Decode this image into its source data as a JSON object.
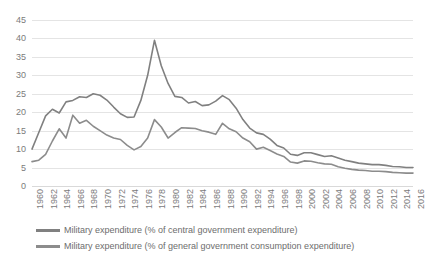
{
  "chart_data": {
    "type": "line",
    "title": "",
    "xlabel": "",
    "ylabel": "",
    "ylim": [
      0,
      45
    ],
    "ytick_step": 5,
    "yticks": [
      "0",
      "5",
      "10",
      "15",
      "20",
      "25",
      "30",
      "35",
      "40",
      "45"
    ],
    "grid": true,
    "legend_position": "bottom",
    "x": [
      1960,
      1961,
      1962,
      1963,
      1964,
      1965,
      1966,
      1967,
      1968,
      1969,
      1970,
      1971,
      1972,
      1973,
      1974,
      1975,
      1976,
      1977,
      1978,
      1979,
      1980,
      1981,
      1982,
      1983,
      1984,
      1985,
      1986,
      1987,
      1988,
      1989,
      1990,
      1991,
      1992,
      1993,
      1994,
      1995,
      1996,
      1997,
      1998,
      1999,
      2000,
      2001,
      2002,
      2003,
      2004,
      2005,
      2006,
      2007,
      2008,
      2009,
      2010,
      2011,
      2012,
      2013,
      2014,
      2015,
      2016
    ],
    "xtick_labels": [
      "1960",
      "1962",
      "1964",
      "1966",
      "1968",
      "1970",
      "1972",
      "1974",
      "1976",
      "1978",
      "1980",
      "1982",
      "1984",
      "1986",
      "1988",
      "1990",
      "1992",
      "1994",
      "1996",
      "1998",
      "2000",
      "2002",
      "2004",
      "2006",
      "2008",
      "2010",
      "2012",
      "2014",
      "2016"
    ],
    "series": [
      {
        "name": "Military expenditure (% of central government expenditure)",
        "color": "#808080",
        "values": [
          10.0,
          14.5,
          19.0,
          20.8,
          19.8,
          22.8,
          23.2,
          24.2,
          24.0,
          25.0,
          24.6,
          23.3,
          21.4,
          19.6,
          18.6,
          18.7,
          23.2,
          30.0,
          39.5,
          32.6,
          27.8,
          24.3,
          24.0,
          22.5,
          22.9,
          21.8,
          22.0,
          23.0,
          24.5,
          23.4,
          21.1,
          18.0,
          15.7,
          14.4,
          14.0,
          12.7,
          11.0,
          10.3,
          8.6,
          8.3,
          9.0,
          9.0,
          8.5,
          8.0,
          8.2,
          7.6,
          7.0,
          6.6,
          6.2,
          6.0,
          5.8,
          5.8,
          5.6,
          5.3,
          5.2,
          5.0,
          5.0
        ]
      },
      {
        "name": "Military expenditure (% of general government consumption expenditure)",
        "color": "#8c8c8c",
        "values": [
          6.6,
          7.0,
          8.6,
          12.2,
          15.5,
          13.0,
          19.2,
          17.0,
          17.8,
          16.2,
          15.0,
          13.8,
          13.0,
          12.6,
          11.0,
          9.8,
          10.7,
          13.0,
          18.0,
          16.0,
          13.0,
          14.5,
          15.8,
          15.7,
          15.6,
          15.0,
          14.6,
          14.0,
          17.0,
          15.5,
          14.7,
          13.0,
          12.0,
          10.0,
          10.5,
          9.6,
          8.7,
          8.0,
          6.5,
          6.2,
          6.8,
          6.7,
          6.3,
          6.0,
          5.9,
          5.2,
          4.8,
          4.5,
          4.3,
          4.2,
          4.0,
          4.0,
          3.9,
          3.7,
          3.6,
          3.5,
          3.5
        ]
      }
    ]
  }
}
